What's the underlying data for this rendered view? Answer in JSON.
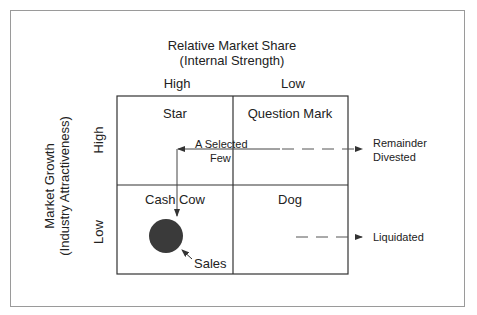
{
  "diagram": {
    "x_axis": {
      "title_line1": "Relative Market Share",
      "title_line2": "(Internal Strength)",
      "high_label": "High",
      "low_label": "Low"
    },
    "y_axis": {
      "title_line1": "Market Growth",
      "title_line2": "(Industry Attractiveness)",
      "high_label": "High",
      "low_label": "Low"
    },
    "quadrants": [
      {
        "position": "top-left",
        "label": "Star"
      },
      {
        "position": "top-right",
        "label": "Question Mark"
      },
      {
        "position": "bottom-left",
        "label": "Cash Cow"
      },
      {
        "position": "bottom-right",
        "label": "Dog"
      }
    ],
    "annotations": {
      "selected_few_line1": "A Selected",
      "selected_few_line2": "Few",
      "remainder_line1": "Remainder",
      "remainder_line2": "Divested",
      "liquidated": "Liquidated",
      "sales": "Sales"
    },
    "colors": {
      "line": "#333333",
      "circle": "#3a3a3a",
      "frame": "#9a9a9a"
    }
  }
}
